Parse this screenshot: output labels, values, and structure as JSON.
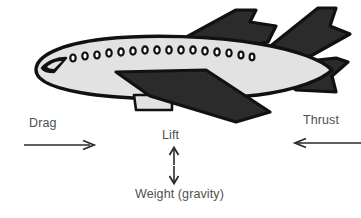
{
  "diagram": {
    "background_color": "#ffffff",
    "illustration": {
      "name": "cartoon-airplane-side-view",
      "fuselage_color": "#e2e2e2",
      "outline_color": "#111111",
      "wing_color": "#2b2b2b",
      "window_count": 16,
      "parts": [
        "nose",
        "cockpit-window",
        "fuselage",
        "passenger-windows",
        "far-wing",
        "near-wing",
        "engine-pod",
        "vertical-stabilizer",
        "horizontal-stabilizer"
      ]
    },
    "forces": [
      {
        "id": "drag",
        "label": "Drag",
        "direction": "right",
        "arrow_name": "drag-arrow"
      },
      {
        "id": "thrust",
        "label": "Thrust",
        "direction": "left",
        "arrow_name": "thrust-arrow"
      },
      {
        "id": "lift",
        "label": "Lift",
        "direction": "up",
        "arrow_name": "lift-arrow"
      },
      {
        "id": "weight",
        "label": "Weight (gravity)",
        "direction": "down",
        "arrow_name": "weight-arrow"
      }
    ],
    "colors": {
      "text": "#4f4f4f",
      "arrow": "#2a2a2a",
      "plane_dark": "#2b2b2b",
      "plane_light": "#e2e2e2",
      "outline": "#111111"
    }
  }
}
